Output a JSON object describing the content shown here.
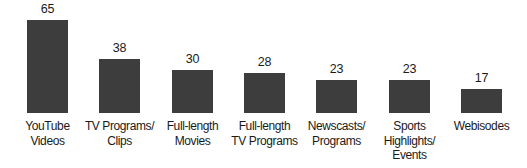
{
  "chart_data": {
    "type": "bar",
    "title": "",
    "xlabel": "",
    "ylabel": "",
    "categories": [
      "YouTube Videos",
      "TV Programs/ Clips",
      "Full-length Movies",
      "Full-length TV Programs",
      "Newscasts/ Programs",
      "Sports Highlights/ Events",
      "Webisodes"
    ],
    "category_lines": [
      [
        "YouTube",
        "Videos"
      ],
      [
        "TV Programs/",
        "Clips"
      ],
      [
        "Full-length",
        "Movies"
      ],
      [
        "Full-length",
        "TV Programs"
      ],
      [
        "Newscasts/",
        "Programs"
      ],
      [
        "Sports",
        "Highlights/",
        "Events"
      ],
      [
        "Webisodes"
      ]
    ],
    "values": [
      65,
      38,
      30,
      28,
      23,
      23,
      17
    ],
    "value_labels": [
      "65",
      "38",
      "30",
      "28",
      "23",
      "23",
      "17"
    ],
    "ylim": [
      0,
      70
    ],
    "grid": false,
    "legend": null,
    "bar_color": "#3d3d3d"
  }
}
